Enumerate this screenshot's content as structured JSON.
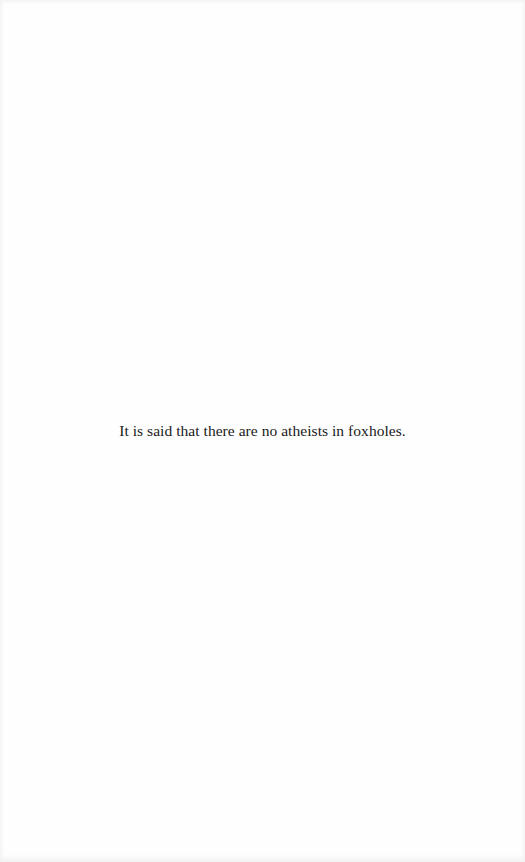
{
  "page": {
    "background": "#fefefe",
    "text_color": "#1a1a1a",
    "paragraphs": [
      "It is said that there are no atheists in foxholes."
    ]
  }
}
